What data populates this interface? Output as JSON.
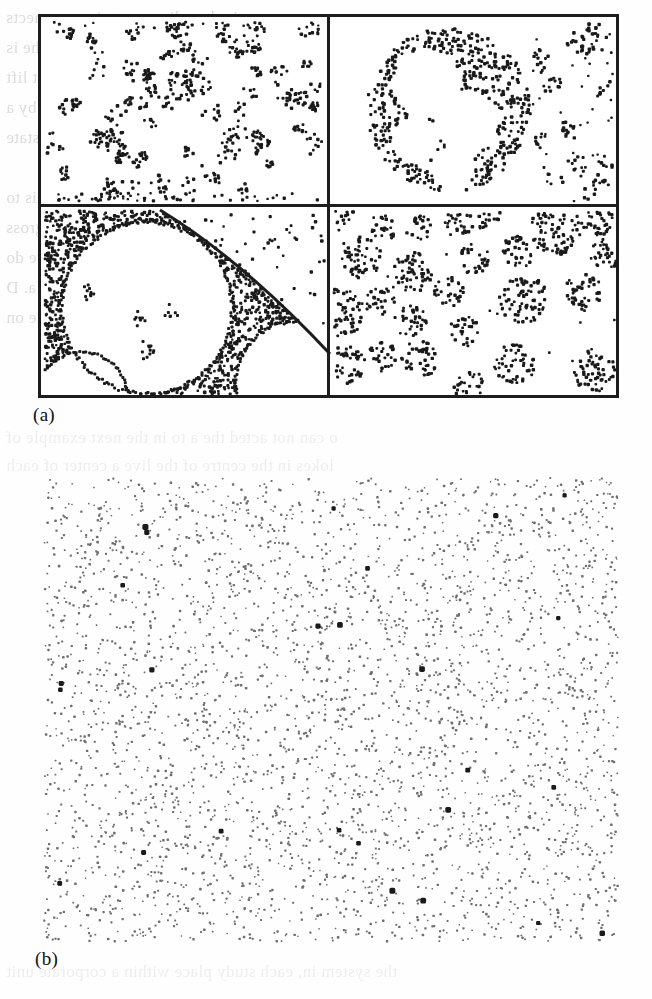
{
  "figure": {
    "caption_a": "(a)",
    "caption_b": "(b)",
    "panel_a_label": "four spatial point pattern quadrants",
    "panel_b_label": "homogeneous Poisson point pattern"
  },
  "ghost_text": {
    "note": "faint mirrored show-through text from the reverse side of the printed page",
    "lines": [
      "ns expressionless   diagram   to   in   reconnects",
      "ne  c  compliance  of  the  most  likely  the  is",
      "the as all assessment on with the a nest lift",
      "the as to be spaced on the a next of a by a",
      "Inter a some qualities my ties B. etc. to state",
      "of their in one of the interests of the essay is to",
      "are escalating have because of the practicality gross",
      "no an a all of the apparent as a term a point we do",
      "the escalation the near the consideration of a. D",
      "the property balance an as we can be an initial the on",
      "",
      "o   can not acted    the  a  to  in  the  next  example of",
      "lokes    in  the  centre  of  the  live  a  center  of  each",
      "",
      "the system in, each study place within a corporate unit"
    ]
  },
  "panel_a": {
    "quadrants": [
      {
        "id": "top-left",
        "pattern": "many small loose clusters scattered uniformly (cluster process, small parent intensity)",
        "n_clusters": 74,
        "dots_per_cluster": [
          4,
          14
        ],
        "cluster_radius_px": [
          5,
          14
        ],
        "dot_size_px": 3.0,
        "extra_edge_dots": 60
      },
      {
        "id": "top-right",
        "pattern": "one large annular super-cluster with internal circular voids plus sparse small clusters at right",
        "big_ring": {
          "cx": 118,
          "cy": 92,
          "r_outer": 82,
          "n_dots": 430,
          "voids": [
            [
              -22,
              -26,
              34
            ],
            [
              18,
              12,
              32
            ],
            [
              -34,
              30,
              24
            ],
            [
              4,
              58,
              22
            ]
          ]
        },
        "n_small_clusters": 17,
        "dots_per_cluster": [
          4,
          12
        ],
        "dot_size_px": 3.2
      },
      {
        "id": "bottom-left",
        "pattern": "dense homogeneous background with large circular voids ringed by dots, and a curved arc boundary separating a sparse region",
        "background_dots": 820,
        "voids": [
          [
            105,
            100,
            86
          ],
          [
            255,
            175,
            62
          ],
          [
            40,
            190,
            46
          ]
        ],
        "arc": {
          "from": [
            118,
            2
          ],
          "to": [
            290,
            134
          ]
        },
        "dot_size_px": 3.0
      },
      {
        "id": "bottom-right",
        "pattern": "well separated dense disc clusters (Matern cluster process, large cluster radius)",
        "n_clusters": 25,
        "dots_per_cluster": [
          14,
          48
        ],
        "cluster_radius_px": [
          13,
          26
        ],
        "dot_size_px": 3.0
      }
    ],
    "frame_color": "#1d1d1d",
    "frame_width_px": 3,
    "divider_color": "#1d1d1d"
  },
  "panel_b": {
    "pattern": "homogeneous (completely random) Poisson point pattern",
    "n_points": 3400,
    "dot_size_px": 2.1,
    "dot_color": "#6f6f6f",
    "dark_outlier_count": 26,
    "dark_outlier_color": "#1a1a1a"
  },
  "colors": {
    "page_background": "#fefefe",
    "panel_background": "#ffffff",
    "ink": "#1a1a1a",
    "grey_ink": "#6f6f6f",
    "ghost": "#c9c9c9"
  }
}
